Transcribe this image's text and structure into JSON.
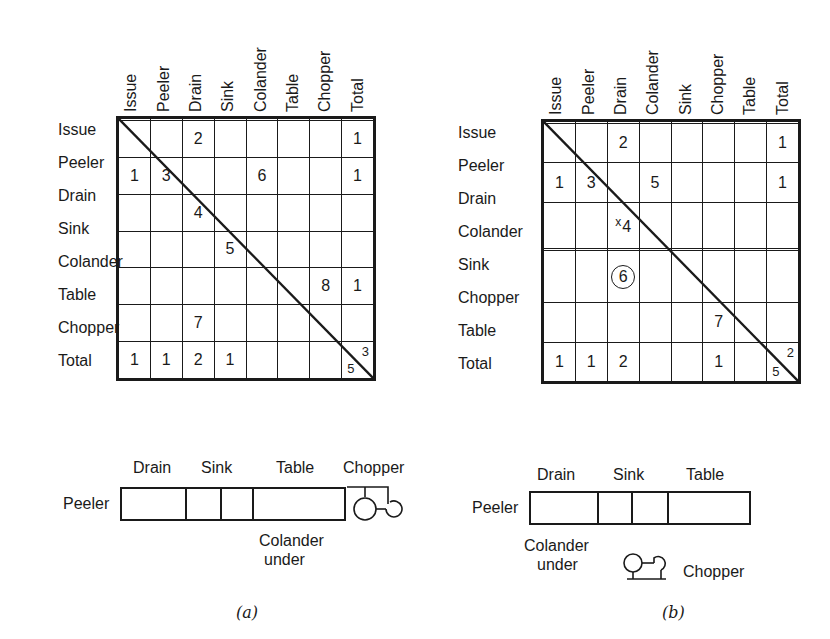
{
  "figure_a": {
    "caption": "(a)",
    "columns": [
      "Issue",
      "Peeler",
      "Drain",
      "Sink",
      "Colander",
      "Table",
      "Chopper",
      "Total"
    ],
    "rows": [
      {
        "label": "Issue",
        "cells": [
          "",
          "",
          "",
          "",
          "",
          "",
          "",
          ""
        ]
      },
      {
        "label": "Peeler",
        "cells": [
          "",
          "",
          "2",
          "",
          "",
          "",
          "",
          "1"
        ]
      },
      {
        "label": "Drain",
        "cells": [
          "1",
          "3",
          "",
          "",
          "6",
          "",
          "",
          "1"
        ]
      },
      {
        "label": "Sink",
        "cells": [
          "",
          "",
          "4",
          "",
          "",
          "",
          "",
          ""
        ]
      },
      {
        "label": "Colander",
        "cells": [
          "",
          "",
          "",
          "5",
          "",
          "",
          "",
          ""
        ]
      },
      {
        "label": "Table",
        "cells": [
          "",
          "",
          "",
          "",
          "",
          "",
          "8",
          "1"
        ]
      },
      {
        "label": "Chopper",
        "cells": [
          "",
          "",
          "7",
          "",
          "",
          "",
          "",
          ""
        ]
      },
      {
        "label": "Total",
        "cells": [
          "1",
          "1",
          "2",
          "1",
          "",
          "",
          "",
          ""
        ]
      }
    ],
    "total_corner": {
      "upper": "3",
      "lower": "5"
    },
    "layout": {
      "left_label": "Peeler",
      "top_labels": [
        "Drain",
        "Sink",
        "Table",
        "Chopper"
      ],
      "bottom_label_line1": "Colander",
      "bottom_label_line2": "under"
    }
  },
  "figure_b": {
    "caption": "(b)",
    "columns": [
      "Issue",
      "Peeler",
      "Drain",
      "Colander",
      "Sink",
      "Chopper",
      "Table",
      "Total"
    ],
    "rows": [
      {
        "label": "Issue",
        "cells": [
          "",
          "",
          "",
          "",
          "",
          "",
          "",
          ""
        ]
      },
      {
        "label": "Peeler",
        "cells": [
          "",
          "",
          "2",
          "",
          "",
          "",
          "",
          "1"
        ]
      },
      {
        "label": "Drain",
        "cells": [
          "1",
          "3",
          "",
          "5",
          "",
          "",
          "",
          "1"
        ]
      },
      {
        "label": "Colander",
        "cells": [
          "",
          "",
          "4",
          "",
          "",
          "",
          "",
          ""
        ]
      },
      {
        "label": "Sink",
        "cells": [
          "",
          "",
          "",
          "",
          "",
          "",
          "",
          ""
        ]
      },
      {
        "label": "Chopper",
        "cells": [
          "",
          "",
          "6",
          "",
          "",
          "",
          "",
          ""
        ]
      },
      {
        "label": "Table",
        "cells": [
          "",
          "",
          "",
          "",
          "",
          "7",
          "",
          ""
        ]
      },
      {
        "label": "Total",
        "cells": [
          "1",
          "1",
          "2",
          "",
          "",
          "1",
          "",
          ""
        ]
      }
    ],
    "annotations": {
      "colander_drain_mark": "x",
      "chopper_drain_circled": true
    },
    "total_corner": {
      "upper": "2",
      "lower": "5"
    },
    "layout": {
      "left_label": "Peeler",
      "top_labels": [
        "Drain",
        "Sink",
        "Table"
      ],
      "bottom_label_line1": "Colander",
      "bottom_label_line2": "under",
      "chopper_label": "Chopper"
    }
  }
}
